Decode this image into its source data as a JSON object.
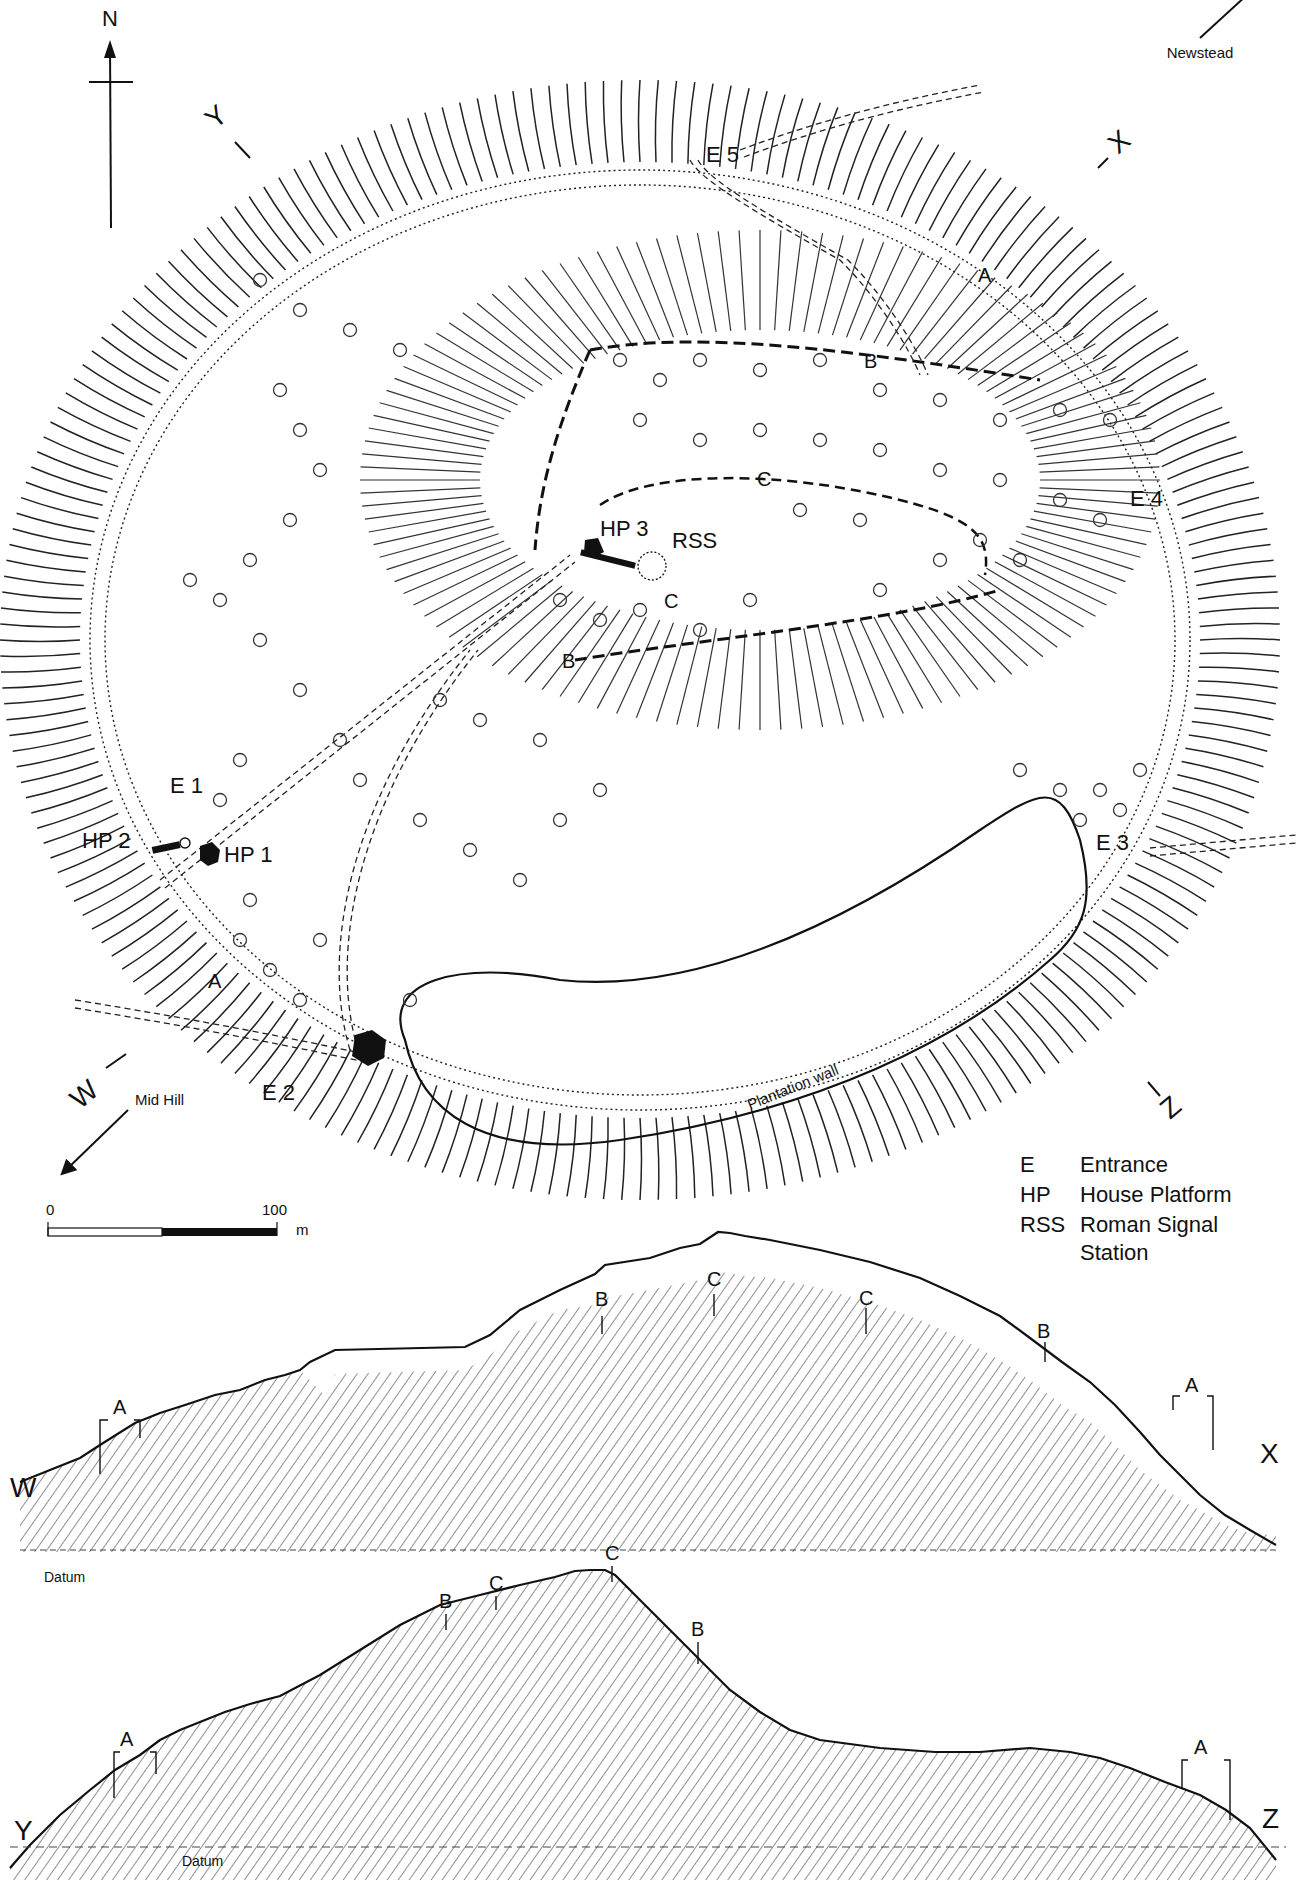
{
  "map": {
    "north_label": "N",
    "direction_labels": {
      "newstead": "Newstead",
      "mid_hill": "Mid Hill"
    },
    "section_endpoints": {
      "w": "W",
      "x": "X",
      "y": "Y",
      "z": "Z"
    },
    "entrances": {
      "e1": "E 1",
      "e2": "E 2",
      "e3": "E 3",
      "e4": "E 4",
      "e5": "E 5"
    },
    "house_platforms": {
      "hp1": "HP 1",
      "hp2": "HP 2",
      "hp3": "HP 3"
    },
    "rss": "RSS",
    "ramparts": {
      "a_north": "A",
      "a_south": "A",
      "b_north": "B",
      "b_south": "B",
      "c_north": "C",
      "c_south": "C"
    },
    "plantation_wall": "Plantation wall",
    "scale_bar": {
      "start": "0",
      "end": "100",
      "unit": "m"
    },
    "legend": [
      {
        "abbr": "E",
        "meaning": "Entrance"
      },
      {
        "abbr": "HP",
        "meaning": "House Platform"
      },
      {
        "abbr": "RSS",
        "meaning": "Roman Signal",
        "meaning_line2": "Station"
      }
    ]
  },
  "sections": [
    {
      "id": "W-X",
      "start": "W",
      "end": "X",
      "datum_label": "Datum",
      "markers": [
        {
          "label": "A",
          "type": "bracket"
        },
        {
          "label": "B",
          "type": "arrow"
        },
        {
          "label": "C",
          "type": "arrow"
        },
        {
          "label": "C",
          "type": "arrow"
        },
        {
          "label": "B",
          "type": "arrow"
        },
        {
          "label": "A",
          "type": "bracket"
        }
      ]
    },
    {
      "id": "Y-Z",
      "start": "Y",
      "end": "Z",
      "datum_label": "Datum",
      "markers": [
        {
          "label": "A",
          "type": "bracket"
        },
        {
          "label": "B",
          "type": "arrow"
        },
        {
          "label": "C",
          "type": "arrow"
        },
        {
          "label": "C",
          "type": "arrow"
        },
        {
          "label": "B",
          "type": "arrow"
        },
        {
          "label": "A",
          "type": "bracket"
        }
      ]
    }
  ]
}
